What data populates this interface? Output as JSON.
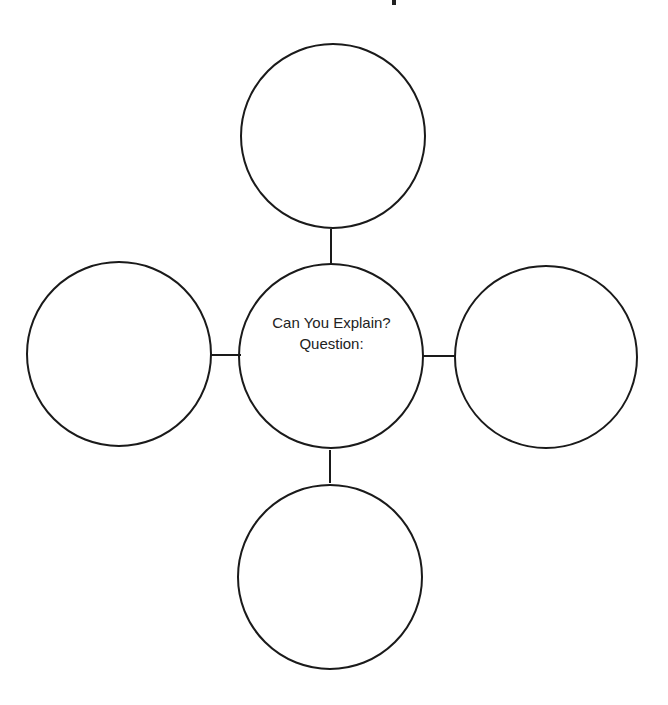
{
  "diagram": {
    "type": "bubble-map",
    "center": {
      "line1": "Can You Explain?",
      "line2": "Question:"
    },
    "satellites": [
      {
        "position": "top",
        "label": ""
      },
      {
        "position": "left",
        "label": ""
      },
      {
        "position": "right",
        "label": ""
      },
      {
        "position": "bottom",
        "label": ""
      }
    ],
    "colors": {
      "stroke": "#1a1a1a",
      "background": "#ffffff",
      "text": "#222222"
    }
  }
}
